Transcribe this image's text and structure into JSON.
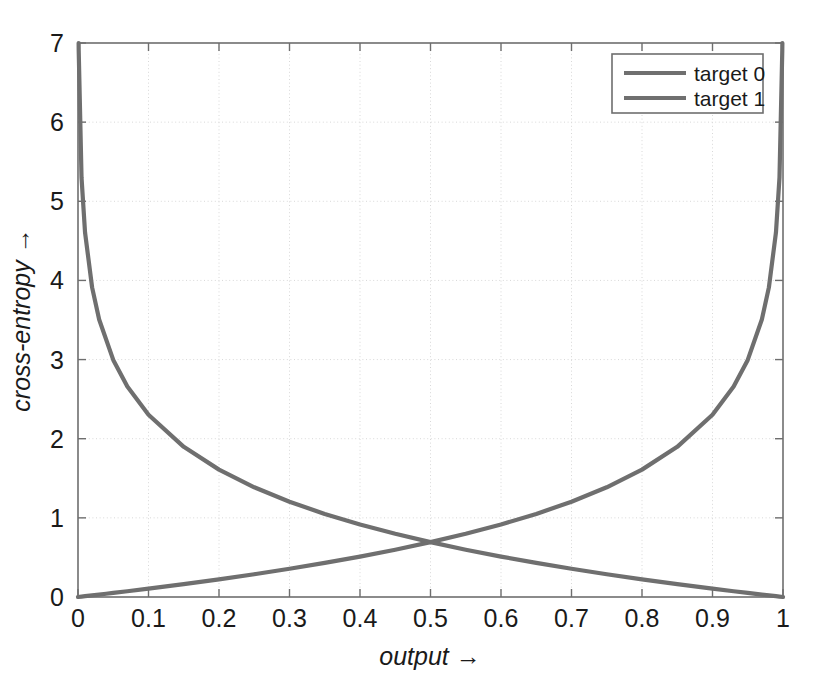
{
  "figure": {
    "background_color": "#ffffff",
    "plot_area": {
      "left": 78,
      "top": 43,
      "right": 783,
      "bottom": 597
    },
    "border_color": "#6e6e6e",
    "grid_color": "#d8d8d8",
    "line_color": "#6f6f6f"
  },
  "chart_data": {
    "type": "line",
    "title": "",
    "subtitle": "",
    "xlabel": "output →",
    "ylabel": "cross-entropy →",
    "xlim": [
      0,
      1
    ],
    "ylim": [
      0,
      7
    ],
    "grid": true,
    "grid_style": "dotted",
    "legend_position": "top-right",
    "x_ticks": [
      0,
      0.1,
      0.2,
      0.3,
      0.4,
      0.5,
      0.6,
      0.7,
      0.8,
      0.9,
      1
    ],
    "x_tick_labels": [
      "0",
      "0.1",
      "0.2",
      "0.3",
      "0.4",
      "0.5",
      "0.6",
      "0.7",
      "0.8",
      "0.9",
      "1"
    ],
    "y_ticks": [
      0,
      1,
      2,
      3,
      4,
      5,
      6,
      7
    ],
    "y_tick_labels": [
      "0",
      "1",
      "2",
      "3",
      "4",
      "5",
      "6",
      "7"
    ],
    "annotations": [],
    "series": [
      {
        "name": "target 0",
        "formula": "-log(1 - output)",
        "description": "cross-entropy for target 0: rises from 0 at output=0 to 7 near output=1",
        "x": [
          0.0,
          0.005,
          0.01,
          0.02,
          0.03,
          0.04,
          0.05,
          0.07,
          0.1,
          0.15,
          0.2,
          0.25,
          0.3,
          0.35,
          0.4,
          0.45,
          0.5,
          0.55,
          0.6,
          0.65,
          0.7,
          0.75,
          0.8,
          0.85,
          0.9,
          0.93,
          0.95,
          0.97,
          0.98,
          0.99,
          0.995,
          0.999,
          0.9991
        ],
        "y": [
          0.0,
          0.005,
          0.01,
          0.0202,
          0.0305,
          0.0408,
          0.0513,
          0.0726,
          0.1054,
          0.1625,
          0.2231,
          0.2877,
          0.3567,
          0.4308,
          0.5108,
          0.5978,
          0.6931,
          0.7985,
          0.9163,
          1.0498,
          1.204,
          1.3863,
          1.6094,
          1.8971,
          2.3026,
          2.6593,
          2.9957,
          3.5066,
          3.912,
          4.6052,
          5.2983,
          6.9078,
          7.0
        ]
      },
      {
        "name": "target 1",
        "formula": "-log(output)",
        "description": "cross-entropy for target 1: falls from 7 near output=0 to 0 at output=1",
        "x": [
          0.0009,
          0.001,
          0.005,
          0.01,
          0.02,
          0.03,
          0.05,
          0.07,
          0.1,
          0.15,
          0.2,
          0.25,
          0.3,
          0.35,
          0.4,
          0.45,
          0.5,
          0.55,
          0.6,
          0.65,
          0.7,
          0.75,
          0.8,
          0.85,
          0.9,
          0.93,
          0.95,
          0.97,
          0.98,
          0.99,
          0.995,
          1.0
        ],
        "y": [
          7.0,
          6.9078,
          5.2983,
          4.6052,
          3.912,
          3.5066,
          2.9957,
          2.6593,
          2.3026,
          1.8971,
          1.6094,
          1.3863,
          1.204,
          1.0498,
          0.9163,
          0.7985,
          0.6931,
          0.5978,
          0.5108,
          0.4308,
          0.3567,
          0.2877,
          0.2231,
          0.1625,
          0.1054,
          0.0726,
          0.0513,
          0.0305,
          0.0202,
          0.0101,
          0.005,
          0.0
        ]
      }
    ],
    "crossing_point": {
      "x": 0.5,
      "y": 0.693
    }
  },
  "legend": {
    "items": [
      {
        "label": "target 0"
      },
      {
        "label": "target 1"
      }
    ]
  }
}
